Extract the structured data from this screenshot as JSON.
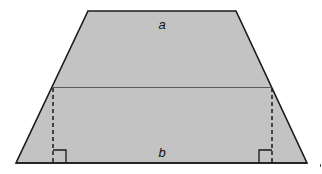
{
  "diagram": {
    "type": "trapezoid-area-decomposition",
    "labels": {
      "top_base": "a",
      "bottom_base": "b"
    },
    "features": {
      "horizontal_divider": true,
      "dashed_heights": 2,
      "right_angle_markers": 2
    },
    "colors": {
      "fill": "#c3c3c3",
      "outline": "#1a1a1a",
      "divider": "#5a5a5a",
      "background": "#ffffff"
    }
  }
}
